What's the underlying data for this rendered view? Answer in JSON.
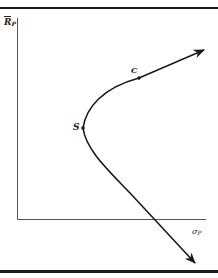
{
  "figure": {
    "type": "portfolio-frontier-diagram",
    "y_axis": {
      "label_main": "R",
      "label_sub": "P",
      "overbar": true
    },
    "x_axis": {
      "label_main": "σ",
      "label_sub": "P"
    },
    "points": [
      {
        "id": "S",
        "label": "S"
      },
      {
        "id": "C",
        "label": "C"
      }
    ],
    "colors": {
      "ink": "#1a1a1a",
      "axis": "#555555",
      "background": "#ffffff"
    }
  }
}
